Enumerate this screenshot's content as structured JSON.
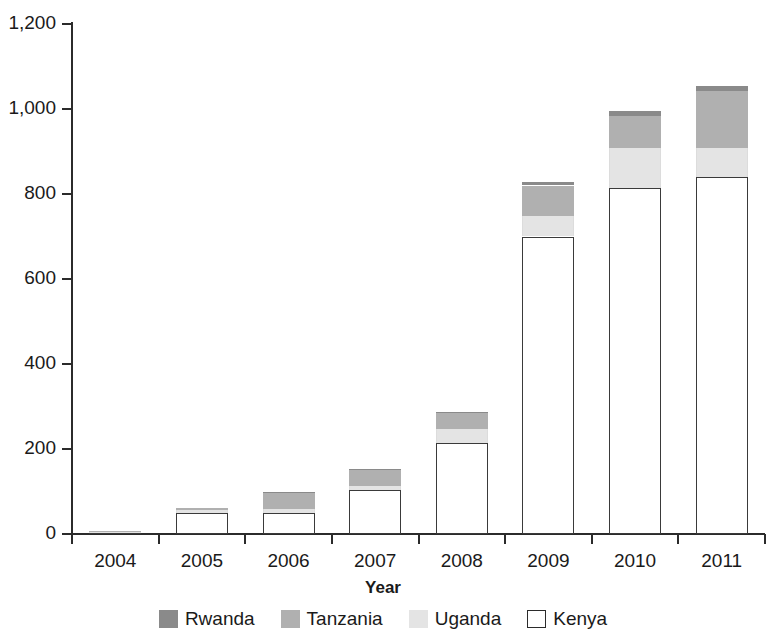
{
  "chart_data": {
    "type": "bar",
    "stacked": true,
    "title": "",
    "subtitle": "",
    "xlabel": "Year",
    "ylabel": "",
    "grid": false,
    "legend_position": "bottom",
    "categories": [
      "2004",
      "2005",
      "2006",
      "2007",
      "2008",
      "2009",
      "2010",
      "2011"
    ],
    "ylim": [
      0,
      1200
    ],
    "yticks": [
      0,
      200,
      400,
      600,
      800,
      1000,
      1200
    ],
    "ytick_labels": [
      "0",
      "200",
      "400",
      "600",
      "800",
      "1,000",
      "1,200"
    ],
    "series": [
      {
        "name": "Kenya",
        "color": "#ffffff",
        "values": [
          6,
          49,
          49,
          104,
          214,
          700,
          815,
          840
        ]
      },
      {
        "name": "Uganda",
        "color": "#e4e4e4",
        "values": [
          1,
          8,
          9,
          9,
          33,
          48,
          94,
          68
        ]
      },
      {
        "name": "Tanzania",
        "color": "#b0b0b0",
        "values": [
          1,
          4,
          38,
          38,
          37,
          72,
          75,
          134
        ]
      },
      {
        "name": "Rwanda",
        "color": "#8a8a8a",
        "values": [
          0,
          0,
          3,
          2,
          4,
          8,
          11,
          13
        ]
      }
    ],
    "totals": [
      8,
      61,
      99,
      153,
      288,
      828,
      995,
      1055
    ]
  },
  "axes": {
    "x_title": "Year"
  },
  "legend": {
    "items": [
      {
        "label": "Rwanda",
        "swatch": "swatch-rwanda",
        "color": "#8a8a8a"
      },
      {
        "label": "Tanzania",
        "swatch": "swatch-tanzania",
        "color": "#b0b0b0"
      },
      {
        "label": "Uganda",
        "swatch": "swatch-uganda",
        "color": "#e4e4e4"
      },
      {
        "label": "Kenya",
        "swatch": "swatch-kenya",
        "color": "#ffffff"
      }
    ]
  }
}
